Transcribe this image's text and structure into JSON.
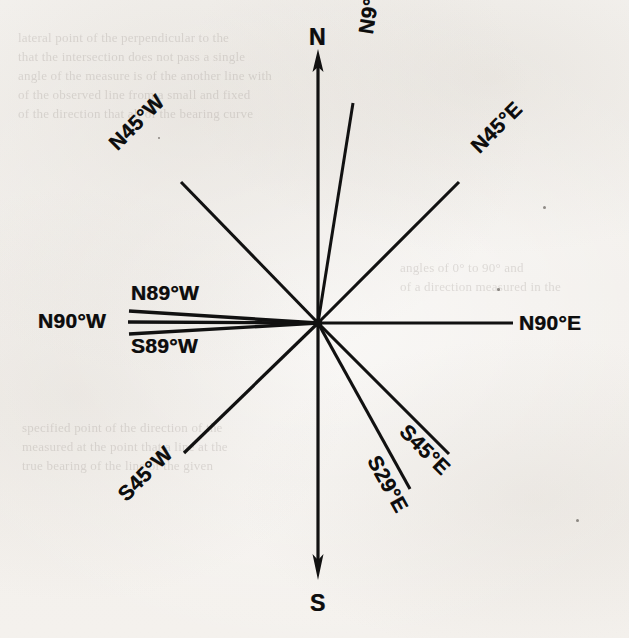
{
  "figure": {
    "type": "compass-bearing-diagram",
    "background_color": "#f4f2ef",
    "ink_color": "#111111"
  },
  "cardinal_axes": [
    {
      "id": "north",
      "label": "N",
      "arrow": "up",
      "label_x": 309,
      "label_y": 26
    },
    {
      "id": "south",
      "label": "S",
      "arrow": "down",
      "label_x": 310,
      "label_y": 592
    }
  ],
  "bearings": [
    {
      "id": "n9e",
      "label": "N9°E",
      "quadrant": "NE",
      "from_meridian": "N",
      "angle_deg": 9,
      "toward": "E",
      "azimuth_deg": 9,
      "rotation_deg": -81,
      "label_x": 354,
      "label_y": 32
    },
    {
      "id": "n45e",
      "label": "N45°E",
      "quadrant": "NE",
      "from_meridian": "N",
      "angle_deg": 45,
      "toward": "E",
      "azimuth_deg": 45,
      "rotation_deg": -45,
      "label_x": 466,
      "label_y": 141
    },
    {
      "id": "n90e",
      "label": "N90°E",
      "quadrant": "E",
      "from_meridian": "N",
      "angle_deg": 90,
      "toward": "E",
      "azimuth_deg": 90,
      "rotation_deg": 0,
      "label_x": 519,
      "label_y": 311
    },
    {
      "id": "s45e",
      "label": "S45°E",
      "quadrant": "SE",
      "from_meridian": "S",
      "angle_deg": 45,
      "toward": "E",
      "azimuth_deg": 135,
      "rotation_deg": 45,
      "label_x": 455,
      "label_y": 463
    },
    {
      "id": "s29e",
      "label": "S29°E",
      "quadrant": "SE",
      "from_meridian": "S",
      "angle_deg": 29,
      "toward": "E",
      "azimuth_deg": 151,
      "rotation_deg": 61,
      "label_x": 413,
      "label_y": 505
    },
    {
      "id": "s45w",
      "label": "S45°W",
      "quadrant": "SW",
      "from_meridian": "S",
      "angle_deg": 45,
      "toward": "W",
      "azimuth_deg": 225,
      "rotation_deg": -45,
      "label_x": 113,
      "label_y": 489
    },
    {
      "id": "s89w",
      "label": "S89°W",
      "quadrant": "SW",
      "from_meridian": "S",
      "angle_deg": 89,
      "toward": "W",
      "azimuth_deg": 269,
      "rotation_deg": 0,
      "label_x": 131,
      "label_y": 334
    },
    {
      "id": "n90w",
      "label": "N90°W",
      "quadrant": "W",
      "from_meridian": "N",
      "angle_deg": 90,
      "toward": "W",
      "azimuth_deg": 270,
      "rotation_deg": 0,
      "label_x": 38,
      "label_y": 309
    },
    {
      "id": "n89w",
      "label": "N89°W",
      "quadrant": "NW",
      "from_meridian": "N",
      "angle_deg": 89,
      "toward": "W",
      "azimuth_deg": 271,
      "rotation_deg": 0,
      "label_x": 131,
      "label_y": 283
    },
    {
      "id": "n45w",
      "label": "N45°W",
      "quadrant": "NW",
      "from_meridian": "N",
      "angle_deg": 45,
      "toward": "W",
      "azimuth_deg": 315,
      "rotation_deg": -45,
      "label_x": 104,
      "label_y": 138
    }
  ],
  "ghost_text": {
    "top": "lateral point of the perpendicular to the\nthat the intersection does not pass a single\nangle of the measure is of the another line with\nof the observed line from a small and fixed\nof the direction that all of the bearing curve",
    "upper_mid": "angles of 0° to 90° and\nof a direction measured in the",
    "lower": "specified point of the direction of the\nmeasured at the point that a line at the\ntrue bearing of the line of the given"
  }
}
